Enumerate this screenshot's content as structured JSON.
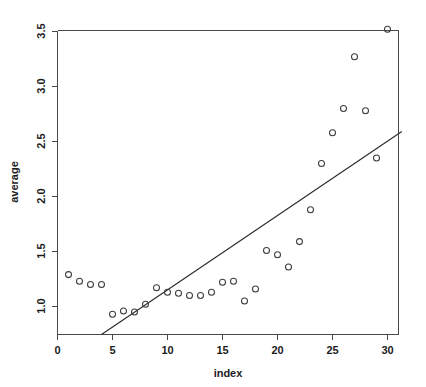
{
  "chart_data": {
    "type": "scatter",
    "title": "",
    "xlabel": "index",
    "ylabel": "average",
    "xlim": [
      0,
      31.3
    ],
    "ylim": [
      0.82,
      3.62
    ],
    "grid": false,
    "legend": "none",
    "x_ticks": [
      0,
      5,
      10,
      15,
      20,
      25,
      30
    ],
    "x_tick_labels": [
      "0",
      "5",
      "10",
      "15",
      "20",
      "25",
      "30"
    ],
    "y_ticks": [
      1.0,
      1.5,
      2.0,
      2.5,
      3.0,
      3.5
    ],
    "y_tick_labels": [
      "1.0",
      "1.5",
      "2.0",
      "2.5",
      "3.0",
      "3.5"
    ],
    "point_marker": "open-circle",
    "point_color": "#3d3d3d",
    "line_color": "#2b2b2b",
    "x": [
      1,
      2,
      3,
      4,
      5,
      6,
      7,
      8,
      9,
      10,
      11,
      12,
      13,
      14,
      15,
      16,
      17,
      18,
      19,
      20,
      21,
      22,
      23,
      24,
      25,
      26,
      27,
      28,
      29,
      30
    ],
    "y": [
      1.29,
      1.23,
      1.2,
      1.2,
      0.93,
      0.96,
      0.95,
      1.02,
      1.17,
      1.13,
      1.12,
      1.1,
      1.1,
      1.13,
      1.22,
      1.23,
      1.05,
      1.16,
      1.51,
      1.47,
      1.36,
      1.59,
      1.88,
      2.3,
      2.58,
      2.8,
      3.27,
      2.78,
      2.35,
      3.52
    ],
    "series": [
      {
        "name": "average",
        "values": [
          1.29,
          1.23,
          1.2,
          1.2,
          0.93,
          0.96,
          0.95,
          1.02,
          1.17,
          1.13,
          1.12,
          1.1,
          1.1,
          1.13,
          1.22,
          1.23,
          1.05,
          1.16,
          1.51,
          1.47,
          1.36,
          1.59,
          1.88,
          2.3,
          2.58,
          2.8,
          3.27,
          2.78,
          2.35,
          3.52
        ]
      }
    ],
    "fit_line": {
      "type": "linear-regression",
      "slope": 0.0676,
      "intercept": 0.4748,
      "x_start": 4.0,
      "y_start": 0.745,
      "x_end": 31.3,
      "y_end": 2.59
    }
  }
}
